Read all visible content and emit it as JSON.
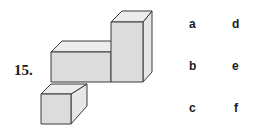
{
  "question": {
    "number": "15."
  },
  "figure": {
    "colors": {
      "front": "#dcdcdc",
      "top": "#ececec",
      "side": "#e6e6e6",
      "stroke": "#3a3a3a"
    }
  },
  "options": [
    {
      "label": "a"
    },
    {
      "label": "b"
    },
    {
      "label": "c"
    },
    {
      "label": "d"
    },
    {
      "label": "e"
    },
    {
      "label": "f"
    }
  ]
}
